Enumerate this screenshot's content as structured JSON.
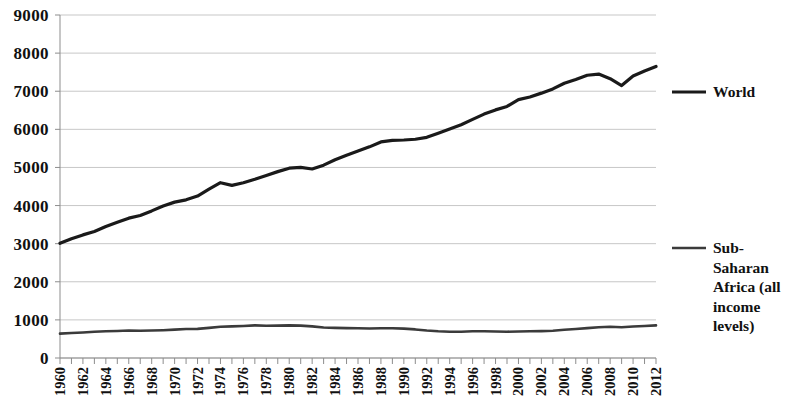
{
  "chart_data": {
    "type": "line",
    "title": "",
    "subtitle": "",
    "xlabel": "",
    "ylabel": "",
    "xlim": [
      1960,
      2012
    ],
    "ylim": [
      0,
      9000
    ],
    "ytick_values": [
      0,
      1000,
      2000,
      3000,
      4000,
      5000,
      6000,
      7000,
      8000,
      9000
    ],
    "ytick_labels": [
      "0",
      "1000",
      "2000",
      "3000",
      "4000",
      "5000",
      "6000",
      "7000",
      "8000",
      "9000"
    ],
    "x": [
      1960,
      1961,
      1962,
      1963,
      1964,
      1965,
      1966,
      1967,
      1968,
      1969,
      1970,
      1971,
      1972,
      1973,
      1974,
      1975,
      1976,
      1977,
      1978,
      1979,
      1980,
      1981,
      1982,
      1983,
      1984,
      1985,
      1986,
      1987,
      1988,
      1989,
      1990,
      1991,
      1992,
      1993,
      1994,
      1995,
      1996,
      1997,
      1998,
      1999,
      2000,
      2001,
      2002,
      2003,
      2004,
      2005,
      2006,
      2007,
      2008,
      2009,
      2010,
      2011,
      2012
    ],
    "xtick_labels": [
      "1960",
      "1962",
      "1964",
      "1966",
      "1968",
      "1970",
      "1972",
      "1974",
      "1976",
      "1978",
      "1980",
      "1982",
      "1984",
      "1986",
      "1988",
      "1990",
      "1992",
      "1994",
      "1996",
      "1998",
      "2000",
      "2002",
      "2004",
      "2006",
      "2008",
      "2010",
      "2012"
    ],
    "xtick_label_interval": 2,
    "minor_ticks_every": 1,
    "grid": "horizontal",
    "legend_position": "right",
    "series": [
      {
        "name": "World",
        "color": "#1a1a1a",
        "line_width": 3.2,
        "values": [
          3010,
          3130,
          3230,
          3320,
          3450,
          3560,
          3670,
          3740,
          3860,
          3990,
          4090,
          4150,
          4250,
          4430,
          4600,
          4530,
          4600,
          4690,
          4790,
          4890,
          4980,
          5000,
          4960,
          5060,
          5200,
          5320,
          5430,
          5540,
          5670,
          5710,
          5720,
          5740,
          5790,
          5900,
          6010,
          6120,
          6260,
          6400,
          6510,
          6600,
          6780,
          6850,
          6950,
          7060,
          7210,
          7310,
          7420,
          7450,
          7330,
          7150,
          7400,
          7530,
          7650
        ]
      },
      {
        "name": "Sub-Saharan Africa (all income levels)",
        "color": "#3b3b3b",
        "line_width": 2.6,
        "values": [
          640,
          655,
          670,
          690,
          700,
          710,
          720,
          715,
          720,
          730,
          745,
          760,
          765,
          790,
          820,
          830,
          840,
          855,
          845,
          850,
          855,
          850,
          830,
          800,
          790,
          785,
          780,
          775,
          780,
          780,
          770,
          750,
          720,
          700,
          690,
          690,
          700,
          700,
          695,
          690,
          695,
          700,
          705,
          715,
          740,
          760,
          785,
          805,
          820,
          805,
          825,
          840,
          855
        ]
      }
    ]
  },
  "legend": {
    "entries": [
      {
        "label": "World",
        "lines": [
          "World"
        ]
      },
      {
        "label": "Sub-Saharan Africa (all income levels)",
        "lines": [
          "Sub-",
          "Saharan",
          "Africa (all",
          "income",
          "levels)"
        ]
      }
    ]
  },
  "colors": {
    "world": "#1a1a1a",
    "subsaharan": "#3b3b3b",
    "gridline": "#b9b9b9",
    "axis": "#8d8d8d",
    "text": "#111111",
    "background": "#ffffff"
  }
}
